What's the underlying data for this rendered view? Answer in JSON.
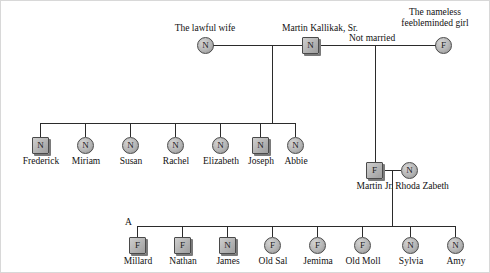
{
  "chart_title": "Kallikak family pedigree chart",
  "annotations": {
    "not_married": "Not married",
    "branch_marker": "A"
  },
  "generation1": {
    "lawful_wife": {
      "label": "The lawful wife",
      "symbol": "circle",
      "code": "N",
      "sex": "female"
    },
    "father": {
      "label": "Martin Kallikak, Sr.",
      "symbol": "square",
      "code": "N",
      "sex": "male"
    },
    "nameless_girl": {
      "label_line1": "The nameless",
      "label_line2": "feebleminded girl",
      "symbol": "circle",
      "code": "F",
      "sex": "female"
    }
  },
  "generation2_lawful": [
    {
      "name": "Frederick",
      "symbol": "square",
      "code": "N",
      "sex": "male"
    },
    {
      "name": "Miriam",
      "symbol": "circle",
      "code": "N",
      "sex": "female"
    },
    {
      "name": "Susan",
      "symbol": "circle",
      "code": "N",
      "sex": "female"
    },
    {
      "name": "Rachel",
      "symbol": "circle",
      "code": "N",
      "sex": "female"
    },
    {
      "name": "Elizabeth",
      "symbol": "circle",
      "code": "N",
      "sex": "female"
    },
    {
      "name": "Joseph",
      "symbol": "square",
      "code": "N",
      "sex": "male"
    },
    {
      "name": "Abbie",
      "symbol": "circle",
      "code": "N",
      "sex": "female"
    }
  ],
  "generation2_illegitimate": {
    "son": {
      "name": "Martin Jr.",
      "symbol": "square",
      "code": "F",
      "sex": "male"
    },
    "spouse": {
      "name": "Rhoda Zabeth",
      "symbol": "circle",
      "code": "N",
      "sex": "female"
    }
  },
  "generation3": [
    {
      "name": "Millard",
      "symbol": "square",
      "code": "F",
      "sex": "male"
    },
    {
      "name": "Nathan",
      "symbol": "square",
      "code": "F",
      "sex": "male"
    },
    {
      "name": "James",
      "symbol": "square",
      "code": "N",
      "sex": "male"
    },
    {
      "name": "Old Sal",
      "symbol": "circle",
      "code": "F",
      "sex": "female"
    },
    {
      "name": "Jemima",
      "symbol": "circle",
      "code": "F",
      "sex": "female"
    },
    {
      "name": "Old Moll",
      "symbol": "circle",
      "code": "F",
      "sex": "female"
    },
    {
      "name": "Sylvia",
      "symbol": "circle",
      "code": "N",
      "sex": "female"
    },
    {
      "name": "Amy",
      "symbol": "circle",
      "code": "N",
      "sex": "female"
    }
  ],
  "colors": {
    "line": "#2b2b2b",
    "symbol_fill": "#b9b9b9",
    "symbol_border": "#4a4a4a",
    "shadow": "#7a7a7a",
    "text": "#111111",
    "background": "#ffffff"
  }
}
